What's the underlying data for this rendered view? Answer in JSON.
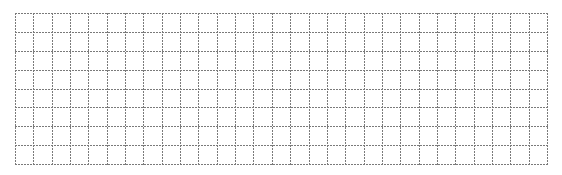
{
  "grid": {
    "columns": 29,
    "rows": 8,
    "left": 15,
    "top": 13,
    "width": 532,
    "height": 151,
    "line_color": "#7a7a7a",
    "line_style": "dotted",
    "background": "#ffffff"
  }
}
